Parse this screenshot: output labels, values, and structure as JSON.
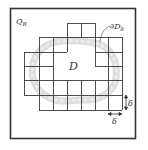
{
  "figure": {
    "region_label": {
      "main": "Q",
      "sub": "R"
    },
    "domain_label": "D",
    "boundary_label": {
      "prefix": "∂D",
      "sub": "δ"
    },
    "cell_size_label_vertical": "δ",
    "cell_size_label_horizontal": "δ",
    "colors": {
      "frame": "#333333",
      "grid": "#3a3a3a",
      "boundary_band": "#d6d6d6",
      "text": "#333333",
      "background": "#ffffff"
    },
    "grid": {
      "cell_size_px": 14,
      "description": "Staircase layer of δ-cells covering the boundary of D, enclosed in square Q_R"
    }
  }
}
